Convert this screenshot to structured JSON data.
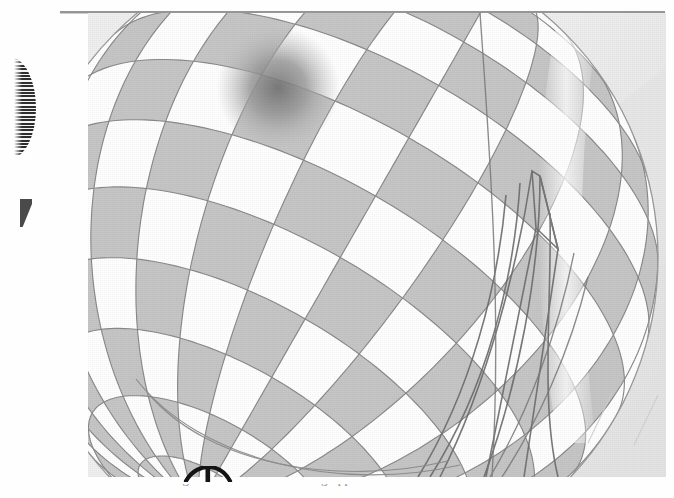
{
  "page": {
    "kind": "scanned-book-page",
    "background_color": "#fefefe",
    "rule_color": "#8d8d8d"
  },
  "margin_marks": {
    "comb_glyph_name": "cut-off-comb-glyph",
    "wedge_glyph_name": "cut-off-wedge-glyph",
    "phi_glyph_name": "cut-off-phi-glyph"
  },
  "figure": {
    "caption_visible": false,
    "pole_x": 278,
    "pole_y": 88,
    "meridian_count": 24,
    "parallel_count": 14,
    "light_color": "#ffffff",
    "dark_color": "#c6c6c6",
    "line_color": "#8a8a8a",
    "overlay_color": "#6f6f6f",
    "backdrop_color": "#efefef",
    "backdrop_shadow_color": "#e2e2e2",
    "overlay_name": "wireframe-polygon-overlay",
    "highlight_name": "specular-highlight-band"
  },
  "bottom_text": {
    "cut_line": "a hidden surface removal algorithm with anti-aliasing applied to the"
  }
}
